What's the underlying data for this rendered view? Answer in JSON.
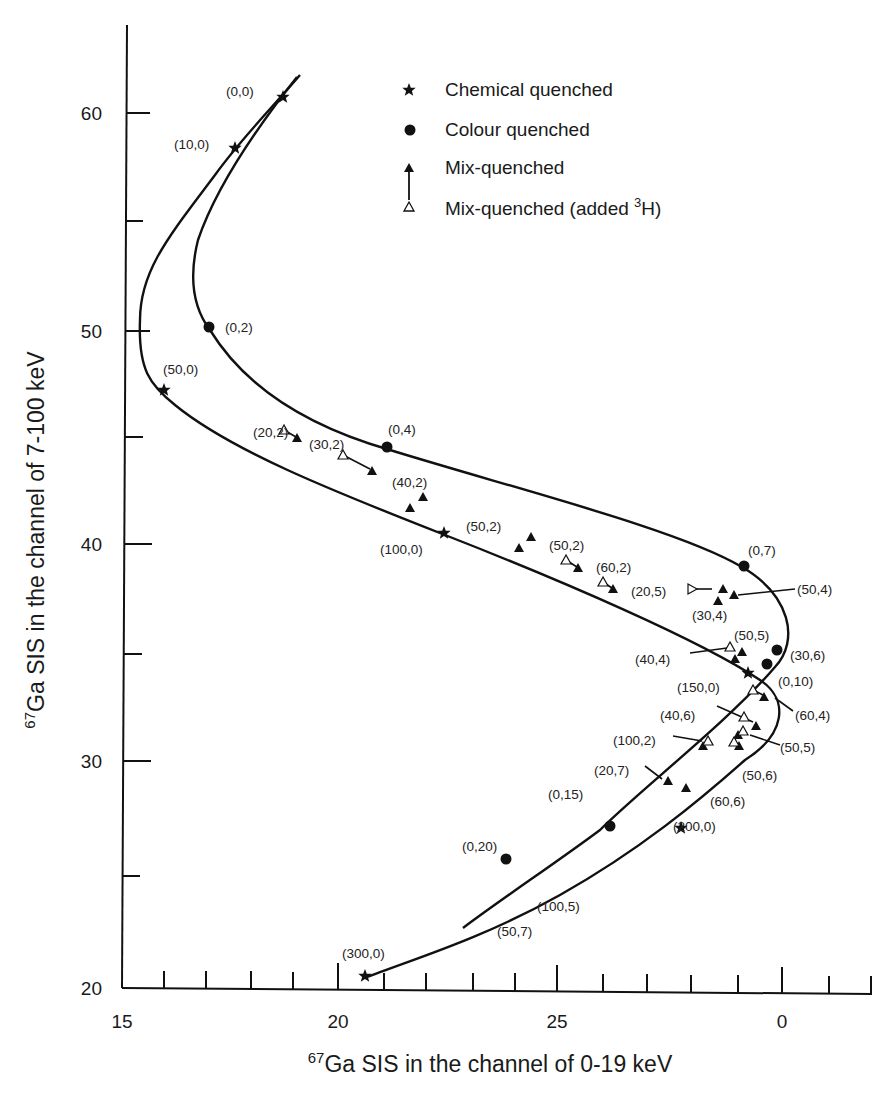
{
  "chart_data": {
    "type": "scatter",
    "title": "",
    "xlabel": {
      "sup": "67",
      "text": "Ga SIS in the channel of 0-19 keV"
    },
    "ylabel": {
      "sup": "67",
      "text": "Ga SIS in the channel of 7-100 keV"
    },
    "x_tick_labels": [
      {
        "label": "15",
        "px": 122
      },
      {
        "label": "20",
        "px": 338
      },
      {
        "label": "25",
        "px": 557
      },
      {
        "label": "0",
        "px": 782
      }
    ],
    "y_tick_labels": [
      {
        "label": "60",
        "px": 113
      },
      {
        "label": "50",
        "px": 331
      },
      {
        "label": "40",
        "px": 544
      },
      {
        "label": "30",
        "px": 761
      },
      {
        "label": "20",
        "px": 988
      }
    ],
    "ylim": [
      20,
      64
    ],
    "xlim": [
      15,
      32
    ],
    "grid": false,
    "legend_position": "upper right",
    "legend": [
      {
        "marker": "star",
        "label": "Chemical quenched"
      },
      {
        "marker": "circle",
        "label": "Colour quenched"
      },
      {
        "marker": "triangle-filled",
        "label": "Mix-quenched"
      },
      {
        "marker": "triangle-open",
        "label": "Mix-quenched (added ",
        "sup": "3",
        "suffix": "H)"
      }
    ],
    "series": [
      {
        "name": "Chemical quenched",
        "marker": "star",
        "points": [
          {
            "label": "(0,0)",
            "x": 21.2,
            "y": 60.8,
            "px": [
              283,
              97
            ]
          },
          {
            "label": "(10,0)",
            "x": 22.3,
            "y": 58.5,
            "px": [
              235,
              148
            ]
          },
          {
            "label": "(50,0)",
            "x": 13.9,
            "y": 47.2,
            "px": [
              164,
              390
            ]
          },
          {
            "label": "(100,0)",
            "x": 22.6,
            "y": 40.5,
            "px": [
              444,
              533
            ]
          },
          {
            "label": "(150,0)",
            "x": 29.4,
            "y": 34.1,
            "px": [
              748,
              673
            ]
          },
          {
            "label": "(200,0)",
            "x": 28.0,
            "y": 28.3,
            "px": [
              681,
              828
            ]
          },
          {
            "label": "(300,0)",
            "x": 20.8,
            "y": 20.5,
            "px": [
              365,
              976
            ]
          }
        ]
      },
      {
        "name": "Colour quenched",
        "marker": "circle",
        "points": [
          {
            "label": "(0,2)",
            "x": 17.9,
            "y": 50.1,
            "px": [
              209,
              327
            ]
          },
          {
            "label": "(0,4)",
            "x": 21.2,
            "y": 44.5,
            "px": [
              387,
              447
            ]
          },
          {
            "label": "(0,7)",
            "x": 29.3,
            "y": 38.9,
            "px": [
              744,
              566
            ]
          },
          {
            "label": "(30,6)",
            "x": 29.9,
            "y": 35.1,
            "px": [
              777,
              650
            ]
          },
          {
            "label": "(0,10)",
            "x": 29.7,
            "y": 34.5,
            "px": [
              767,
              664
            ]
          },
          {
            "label": "(0,15)",
            "x": 25.9,
            "y": 28.3,
            "px": [
              610,
              826
            ]
          },
          {
            "label": "(0,20)",
            "x": 23.9,
            "y": 25.6,
            "px": [
              506,
              859
            ]
          }
        ]
      },
      {
        "name": "Mix-quenched",
        "marker": "triangle-filled",
        "points": [
          {
            "label": "(20,2)",
            "px": [
              297,
              438
            ]
          },
          {
            "label": "(30,2)",
            "px": [
              372,
              471
            ]
          },
          {
            "label": "(40,2)",
            "px": [
              410,
              508
            ]
          },
          {
            "label": "(40,2)b",
            "px": [
              423,
              497
            ]
          },
          {
            "label": "(50,2)",
            "px": [
              519,
              548
            ]
          },
          {
            "label": "(50,2)b",
            "px": [
              531,
              537
            ]
          },
          {
            "label": "(50,2)c",
            "px": [
              578,
              568
            ]
          },
          {
            "label": "(60,2)",
            "px": [
              613,
              589
            ]
          },
          {
            "label": "(20,5)",
            "px": [
              723,
              589
            ]
          },
          {
            "label": "(30,4)",
            "px": [
              718,
              601
            ]
          },
          {
            "label": "(50,4)",
            "px": [
              734,
              595
            ]
          },
          {
            "label": "(50,5)",
            "px": [
              742,
              652
            ]
          },
          {
            "label": "(40,4)",
            "px": [
              735,
              659
            ]
          },
          {
            "label": "(60,4)",
            "px": [
              764,
              697
            ]
          },
          {
            "label": "(40,6)",
            "px": [
              756,
              726
            ]
          },
          {
            "label": "(50,5)b",
            "px": [
              738,
              735
            ]
          },
          {
            "label": "(50,6)",
            "px": [
              739,
              746
            ]
          },
          {
            "label": "(100,2)",
            "px": [
              703,
              746
            ]
          },
          {
            "label": "(20,7)",
            "px": [
              668,
              781
            ]
          },
          {
            "label": "(60,6)",
            "px": [
              686,
              788
            ]
          }
        ]
      },
      {
        "name": "Mix-quenched (added 3H)",
        "marker": "triangle-open",
        "points": [
          {
            "label": "(20,2)",
            "px": [
              284,
              430
            ]
          },
          {
            "label": "(30,2)",
            "px": [
              343,
              455
            ]
          },
          {
            "label": "(50,2)",
            "px": [
              566,
              560
            ]
          },
          {
            "label": "(60,2)",
            "px": [
              603,
              582
            ]
          },
          {
            "label": "(20,5)",
            "px": [
              692,
              589
            ],
            "rotated": true
          },
          {
            "label": "(50,5)",
            "px": [
              730,
              647
            ]
          },
          {
            "label": "(0,10)",
            "px": [
              753,
              690
            ]
          },
          {
            "label": "(40,6)",
            "px": [
              744,
              717
            ]
          },
          {
            "label": "(50,5)b",
            "px": [
              743,
              731
            ]
          },
          {
            "label": "(50,6)",
            "px": [
              734,
              742
            ]
          },
          {
            "label": "(100,2)",
            "px": [
              708,
              741
            ]
          }
        ]
      }
    ],
    "annotations": [
      {
        "text": "(0,0)",
        "px": [
          226,
          96
        ]
      },
      {
        "text": "(10,0)",
        "px": [
          174,
          149
        ]
      },
      {
        "text": "(0,2)",
        "px": [
          225,
          332
        ]
      },
      {
        "text": "(50,0)",
        "px": [
          163,
          374
        ]
      },
      {
        "text": "(20,2)",
        "px": [
          253,
          437
        ]
      },
      {
        "text": "(0,4)",
        "px": [
          388,
          434
        ]
      },
      {
        "text": "(30,2)",
        "px": [
          309,
          449
        ]
      },
      {
        "text": "(40,2)",
        "px": [
          392,
          487
        ]
      },
      {
        "text": "(100,0)",
        "px": [
          380,
          554
        ]
      },
      {
        "text": "(50,2)",
        "px": [
          466,
          531
        ]
      },
      {
        "text": "(50,2)",
        "px": [
          549,
          550
        ]
      },
      {
        "text": "(60,2)",
        "px": [
          596,
          572
        ]
      },
      {
        "text": "(0,7)",
        "px": [
          748,
          555
        ]
      },
      {
        "text": "(20,5)",
        "px": [
          631,
          596
        ]
      },
      {
        "text": "(50,4)",
        "px": [
          797,
          594
        ]
      },
      {
        "text": "(30,4)",
        "px": [
          692,
          620
        ]
      },
      {
        "text": "(50,5)",
        "px": [
          734,
          640
        ]
      },
      {
        "text": "(40,4)",
        "px": [
          635,
          664
        ]
      },
      {
        "text": "(30,6)",
        "px": [
          790,
          660
        ]
      },
      {
        "text": "(150,0)",
        "px": [
          677,
          692
        ]
      },
      {
        "text": "(0,10)",
        "px": [
          778,
          686
        ]
      },
      {
        "text": "(60,4)",
        "px": [
          795,
          720
        ]
      },
      {
        "text": "(40,6)",
        "px": [
          660,
          720
        ]
      },
      {
        "text": "(100,2)",
        "px": [
          613,
          745
        ]
      },
      {
        "text": "(50,5)",
        "px": [
          780,
          752
        ]
      },
      {
        "text": "(20,7)",
        "px": [
          594,
          775
        ]
      },
      {
        "text": "(50,6)",
        "px": [
          742,
          780
        ]
      },
      {
        "text": "(0,15)",
        "px": [
          548,
          799
        ]
      },
      {
        "text": "(60,6)",
        "px": [
          710,
          806
        ]
      },
      {
        "text": "(200,0)",
        "px": [
          673,
          831
        ]
      },
      {
        "text": "(0,20)",
        "px": [
          462,
          851
        ]
      },
      {
        "text": "(100,5)",
        "px": [
          537,
          911
        ]
      },
      {
        "text": "(50,7)",
        "px": [
          497,
          936
        ]
      },
      {
        "text": "(300,0)",
        "px": [
          342,
          958
        ]
      }
    ]
  }
}
